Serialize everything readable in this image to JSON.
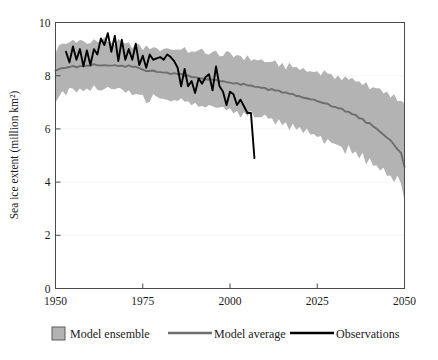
{
  "chart_data": {
    "type": "line",
    "title": "",
    "xlabel": "",
    "ylabel": "Sea ice extent (million km²)",
    "xlim": [
      1950,
      2050
    ],
    "ylim": [
      0,
      10
    ],
    "xticks": [
      1950,
      1975,
      2000,
      2025,
      2050
    ],
    "yticks": [
      0,
      2,
      4,
      6,
      8,
      10
    ],
    "xtick_labels": [
      "1950",
      "1975",
      "2000",
      "2025",
      "2050"
    ],
    "ytick_labels": [
      "0",
      "2",
      "4",
      "6",
      "8",
      "10"
    ],
    "grid": false,
    "legend_position": "below",
    "colors": {
      "ensemble_band": "#b3b3b3",
      "model_average": "#6e6e6e",
      "observations": "#000000",
      "frame": "#4a4a4a",
      "background": "#ffffff"
    },
    "series": [
      {
        "name": "Model ensemble",
        "type": "band",
        "x": [
          1950,
          1951,
          1952,
          1953,
          1954,
          1955,
          1956,
          1957,
          1958,
          1959,
          1960,
          1961,
          1962,
          1963,
          1964,
          1965,
          1966,
          1967,
          1968,
          1969,
          1970,
          1971,
          1972,
          1973,
          1974,
          1975,
          1976,
          1977,
          1978,
          1979,
          1980,
          1981,
          1982,
          1983,
          1984,
          1985,
          1986,
          1987,
          1988,
          1989,
          1990,
          1991,
          1992,
          1993,
          1994,
          1995,
          1996,
          1997,
          1998,
          1999,
          2000,
          2001,
          2002,
          2003,
          2004,
          2005,
          2006,
          2007,
          2008,
          2009,
          2010,
          2011,
          2012,
          2013,
          2014,
          2015,
          2016,
          2017,
          2018,
          2019,
          2020,
          2021,
          2022,
          2023,
          2024,
          2025,
          2026,
          2027,
          2028,
          2029,
          2030,
          2031,
          2032,
          2033,
          2034,
          2035,
          2036,
          2037,
          2038,
          2039,
          2040,
          2041,
          2042,
          2043,
          2044,
          2045,
          2046,
          2047,
          2048,
          2049,
          2050
        ],
        "upper": [
          8.9,
          9.1,
          9.2,
          9.2,
          9.3,
          9.3,
          9.2,
          9.35,
          9.3,
          9.2,
          9.3,
          9.35,
          9.25,
          9.3,
          9.4,
          9.3,
          9.25,
          9.2,
          9.3,
          9.25,
          9.15,
          9.2,
          9.1,
          9.2,
          9.1,
          9.0,
          9.1,
          9.05,
          9.0,
          9.1,
          8.95,
          9.0,
          9.05,
          9.0,
          8.95,
          9.05,
          8.95,
          9.0,
          8.9,
          8.95,
          8.85,
          8.9,
          9.0,
          8.9,
          8.8,
          8.85,
          8.9,
          8.8,
          8.75,
          8.85,
          8.8,
          8.7,
          8.8,
          8.75,
          8.65,
          8.7,
          8.6,
          8.65,
          8.55,
          8.6,
          8.5,
          8.55,
          8.45,
          8.5,
          8.4,
          8.45,
          8.3,
          8.4,
          8.3,
          8.35,
          8.2,
          8.3,
          8.15,
          8.25,
          8.1,
          8.2,
          8.05,
          8.15,
          8.0,
          8.1,
          7.95,
          8.0,
          7.85,
          7.95,
          7.8,
          7.9,
          7.75,
          7.85,
          7.65,
          7.75,
          7.55,
          7.6,
          7.45,
          7.5,
          7.3,
          7.35,
          7.2,
          7.25,
          7.05,
          7.1,
          6.95
        ],
        "lower": [
          7.1,
          7.3,
          7.45,
          7.3,
          7.45,
          7.5,
          7.35,
          7.5,
          7.4,
          7.5,
          7.45,
          7.55,
          7.4,
          7.5,
          7.45,
          7.55,
          7.4,
          7.5,
          7.45,
          7.5,
          7.35,
          7.45,
          7.35,
          7.4,
          7.3,
          7.2,
          6.95,
          7.1,
          7.3,
          7.15,
          7.25,
          7.1,
          7.2,
          7.05,
          7.15,
          7.0,
          7.1,
          6.95,
          7.05,
          6.9,
          7.0,
          6.85,
          6.95,
          6.8,
          6.9,
          6.75,
          6.85,
          6.7,
          6.8,
          6.65,
          6.75,
          6.6,
          6.7,
          6.5,
          6.65,
          6.45,
          6.6,
          6.4,
          6.5,
          6.35,
          6.45,
          6.3,
          6.4,
          6.2,
          6.3,
          6.1,
          6.25,
          6.0,
          6.15,
          5.9,
          6.05,
          5.8,
          5.95,
          5.7,
          5.85,
          5.6,
          5.7,
          5.5,
          5.6,
          5.4,
          5.5,
          5.3,
          5.4,
          5.15,
          5.3,
          5.0,
          5.15,
          4.85,
          5.0,
          4.7,
          4.85,
          4.55,
          4.7,
          4.4,
          4.55,
          4.2,
          4.35,
          4.0,
          4.15,
          3.85,
          3.4
        ]
      },
      {
        "name": "Model average",
        "type": "line",
        "x": [
          1950,
          1951,
          1952,
          1953,
          1954,
          1955,
          1956,
          1957,
          1958,
          1959,
          1960,
          1961,
          1962,
          1963,
          1964,
          1965,
          1966,
          1967,
          1968,
          1969,
          1970,
          1971,
          1972,
          1973,
          1974,
          1975,
          1976,
          1977,
          1978,
          1979,
          1980,
          1981,
          1982,
          1983,
          1984,
          1985,
          1986,
          1987,
          1988,
          1989,
          1990,
          1991,
          1992,
          1993,
          1994,
          1995,
          1996,
          1997,
          1998,
          1999,
          2000,
          2001,
          2002,
          2003,
          2004,
          2005,
          2006,
          2007,
          2008,
          2009,
          2010,
          2011,
          2012,
          2013,
          2014,
          2015,
          2016,
          2017,
          2018,
          2019,
          2020,
          2021,
          2022,
          2023,
          2024,
          2025,
          2026,
          2027,
          2028,
          2029,
          2030,
          2031,
          2032,
          2033,
          2034,
          2035,
          2036,
          2037,
          2038,
          2039,
          2040,
          2041,
          2042,
          2043,
          2044,
          2045,
          2046,
          2047,
          2048,
          2049,
          2050
        ],
        "y": [
          8.2,
          8.25,
          8.3,
          8.28,
          8.32,
          8.35,
          8.3,
          8.38,
          8.35,
          8.4,
          8.38,
          8.42,
          8.38,
          8.4,
          8.42,
          8.4,
          8.38,
          8.4,
          8.38,
          8.4,
          8.35,
          8.38,
          8.32,
          8.35,
          8.3,
          8.25,
          8.15,
          8.2,
          8.18,
          8.15,
          8.12,
          8.1,
          8.12,
          8.08,
          8.1,
          8.05,
          8.05,
          8.0,
          8.0,
          7.95,
          7.95,
          7.9,
          7.92,
          7.88,
          7.88,
          7.85,
          7.85,
          7.8,
          7.8,
          7.75,
          7.75,
          7.7,
          7.72,
          7.65,
          7.68,
          7.62,
          7.65,
          7.58,
          7.58,
          7.52,
          7.55,
          7.48,
          7.48,
          7.42,
          7.42,
          7.35,
          7.38,
          7.3,
          7.3,
          7.22,
          7.25,
          7.18,
          7.15,
          7.1,
          7.08,
          7.05,
          7.0,
          6.95,
          6.95,
          6.85,
          6.85,
          6.78,
          6.75,
          6.65,
          6.65,
          6.55,
          6.5,
          6.4,
          6.38,
          6.25,
          6.2,
          6.1,
          6.0,
          5.88,
          5.8,
          5.65,
          5.55,
          5.4,
          5.25,
          5.1,
          4.6
        ]
      },
      {
        "name": "Observations",
        "type": "line",
        "x": [
          1953,
          1954,
          1955,
          1956,
          1957,
          1958,
          1959,
          1960,
          1961,
          1962,
          1963,
          1964,
          1965,
          1966,
          1967,
          1968,
          1969,
          1970,
          1971,
          1972,
          1973,
          1974,
          1975,
          1976,
          1977,
          1978,
          1979,
          1980,
          1981,
          1982,
          1983,
          1984,
          1985,
          1986,
          1987,
          1988,
          1989,
          1990,
          1991,
          1992,
          1993,
          1994,
          1995,
          1996,
          1997,
          1998,
          1999,
          2000,
          2001,
          2002,
          2003,
          2004,
          2005,
          2006,
          2007
        ],
        "y": [
          8.9,
          8.5,
          9.1,
          8.6,
          9.0,
          8.35,
          8.95,
          8.4,
          9.0,
          8.8,
          9.4,
          9.15,
          9.6,
          8.9,
          9.5,
          8.55,
          9.35,
          8.6,
          9.0,
          8.6,
          9.2,
          8.4,
          8.75,
          8.3,
          8.8,
          8.6,
          8.65,
          8.7,
          8.6,
          8.8,
          8.7,
          8.55,
          8.3,
          7.6,
          8.25,
          7.6,
          7.8,
          7.35,
          7.9,
          7.7,
          7.95,
          8.05,
          7.45,
          8.35,
          7.6,
          7.4,
          6.9,
          7.4,
          7.3,
          6.9,
          7.1,
          6.85,
          6.6,
          6.6,
          4.9
        ]
      }
    ]
  },
  "axis": {
    "y_title": "Sea ice extent (million km²)"
  },
  "legend": {
    "items": [
      {
        "label": "Model ensemble",
        "marker": "swatch",
        "color": "#b3b3b3"
      },
      {
        "label": "Model average",
        "marker": "line",
        "color": "#6e6e6e"
      },
      {
        "label": "Observations",
        "marker": "line",
        "color": "#000000"
      }
    ]
  }
}
